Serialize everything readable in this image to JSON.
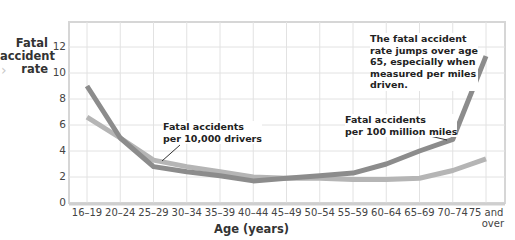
{
  "chart_data": {
    "type": "line",
    "title": "",
    "xlabel": "Age (years)",
    "ylabel": "Fatal accident rate",
    "ylim": [
      0,
      13.5
    ],
    "yticks": [
      0,
      2,
      4,
      6,
      8,
      10,
      12
    ],
    "grid": true,
    "legend": "inline annotations",
    "categories": [
      "16–19",
      "20–24",
      "25–29",
      "30–34",
      "35–39",
      "40–44",
      "45–49",
      "50–54",
      "55–59",
      "60–64",
      "65–69",
      "70–74",
      "75 and over"
    ],
    "series": [
      {
        "name": "Fatal accidents per 100 million miles",
        "color": "#8c8c8c",
        "values": [
          9.0,
          5.0,
          2.8,
          2.4,
          2.1,
          1.7,
          1.9,
          2.1,
          2.3,
          3.0,
          4.0,
          4.9,
          11.3
        ]
      },
      {
        "name": "Fatal accidents per 10,000 drivers",
        "color": "#b5b5b5",
        "values": [
          6.6,
          5.0,
          3.3,
          2.8,
          2.4,
          2.0,
          1.9,
          1.9,
          1.8,
          1.8,
          1.9,
          2.5,
          3.4
        ]
      }
    ],
    "annotations": [
      {
        "text": [
          "Fatal accidents",
          "per 10,000 drivers"
        ],
        "target_series": 1
      },
      {
        "text": [
          "Fatal accidents",
          "per 100 million miles"
        ],
        "target_series": 0
      },
      {
        "text": [
          "The fatal accident",
          "rate jumps over age",
          "65, especially when",
          "measured per miles",
          "driven."
        ]
      }
    ]
  },
  "labels": {
    "ylabel_lines": [
      "Fatal",
      "accident",
      "rate"
    ],
    "xlabel": "Age (years)",
    "xtick_last_lines": [
      "75 and",
      "over"
    ],
    "nav_arrow": "›"
  }
}
